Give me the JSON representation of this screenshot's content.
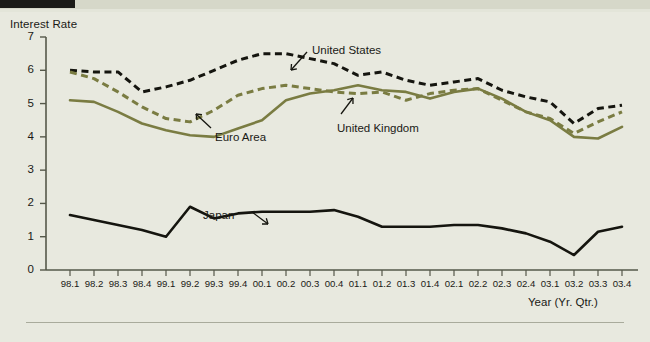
{
  "figure": {
    "background_color": "#e8e9df",
    "header_bar_color": "#1b1b18",
    "header_strip_color": "#d6d8c9"
  },
  "chart_data": {
    "type": "line",
    "title": "",
    "subtitle": "",
    "ylabel": "Interest Rate",
    "xlabel": "Year (Yr. Qtr.)",
    "ylim": [
      0,
      7
    ],
    "yticks": [
      0,
      1,
      2,
      3,
      4,
      5,
      6,
      7
    ],
    "grid": false,
    "legend": "inline-annotations",
    "categories": [
      "98.1",
      "98.2",
      "98.3",
      "98.4",
      "99.1",
      "99.2",
      "99.3",
      "99.4",
      "00.1",
      "00.2",
      "00.3",
      "00.4",
      "01.1",
      "01.2",
      "01.3",
      "01.4",
      "02.1",
      "02.2",
      "02.3",
      "02.4",
      "03.1",
      "03.2",
      "03.3",
      "03.4"
    ],
    "series": [
      {
        "name": "United States",
        "color": "#15150f",
        "style": "dashed",
        "values": [
          6.0,
          5.95,
          5.95,
          5.35,
          5.5,
          5.7,
          6.0,
          6.3,
          6.5,
          6.5,
          6.35,
          6.2,
          5.85,
          5.95,
          5.7,
          5.55,
          5.65,
          5.75,
          5.4,
          5.2,
          5.05,
          4.4,
          4.85,
          4.95
        ]
      },
      {
        "name": "United Kingdom",
        "color": "#7a7c42",
        "style": "dashed",
        "values": [
          5.95,
          5.75,
          5.35,
          4.9,
          4.55,
          4.45,
          4.8,
          5.25,
          5.45,
          5.55,
          5.45,
          5.35,
          5.3,
          5.35,
          5.1,
          5.3,
          5.4,
          5.45,
          5.1,
          4.75,
          4.55,
          4.1,
          4.45,
          4.75
        ]
      },
      {
        "name": "Euro Area",
        "color": "#7a7c42",
        "style": "solid",
        "values": [
          5.1,
          5.05,
          4.75,
          4.4,
          4.2,
          4.05,
          4.0,
          4.25,
          4.5,
          5.1,
          5.3,
          5.4,
          5.55,
          5.4,
          5.35,
          5.15,
          5.35,
          5.45,
          5.15,
          4.75,
          4.5,
          4.0,
          3.95,
          4.3
        ]
      },
      {
        "name": "Japan",
        "color": "#15150f",
        "style": "solid",
        "values": [
          1.65,
          1.5,
          1.35,
          1.2,
          1.0,
          1.9,
          1.55,
          1.7,
          1.75,
          1.75,
          1.75,
          1.8,
          1.6,
          1.3,
          1.3,
          1.3,
          1.35,
          1.35,
          1.25,
          1.1,
          0.85,
          0.45,
          1.15,
          1.3
        ]
      }
    ],
    "annotations": [
      {
        "text": "United States",
        "x": 312,
        "y": 44
      },
      {
        "text": "United Kingdom",
        "x": 337,
        "y": 122
      },
      {
        "text": "Euro Area",
        "x": 215,
        "y": 131
      },
      {
        "text": "Japan",
        "x": 203,
        "y": 209
      }
    ]
  }
}
